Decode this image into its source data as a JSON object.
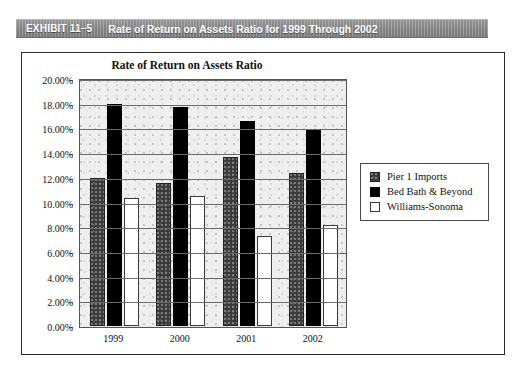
{
  "exhibit": {
    "tag": "EXHIBIT 11–5",
    "title": "Rate of Return on Assets Ratio for 1999 Through 2002"
  },
  "chart_data": {
    "type": "bar",
    "title": "Rate of Return on Assets Ratio",
    "xlabel": "",
    "ylabel": "",
    "categories": [
      "1999",
      "2000",
      "2001",
      "2002"
    ],
    "series": [
      {
        "name": "Pier 1 Imports",
        "color": "#3b3b3b",
        "values": [
          12.0,
          11.6,
          13.7,
          12.4
        ]
      },
      {
        "name": "Bed Bath & Beyond",
        "color": "#000000",
        "values": [
          18.0,
          17.7,
          16.6,
          15.9
        ]
      },
      {
        "name": "Williams-Sonoma",
        "color": "#ffffff",
        "values": [
          10.4,
          10.5,
          7.3,
          8.2
        ]
      }
    ],
    "ylim": [
      0,
      20
    ],
    "ytick_step": 2,
    "ytick_labels": [
      "0.00%",
      "2.00%",
      "4.00%",
      "6.00%",
      "8.00%",
      "10.00%",
      "12.00%",
      "14.00%",
      "16.00%",
      "18.00%",
      "20.00%"
    ],
    "grid": true,
    "legend_position": "right"
  }
}
